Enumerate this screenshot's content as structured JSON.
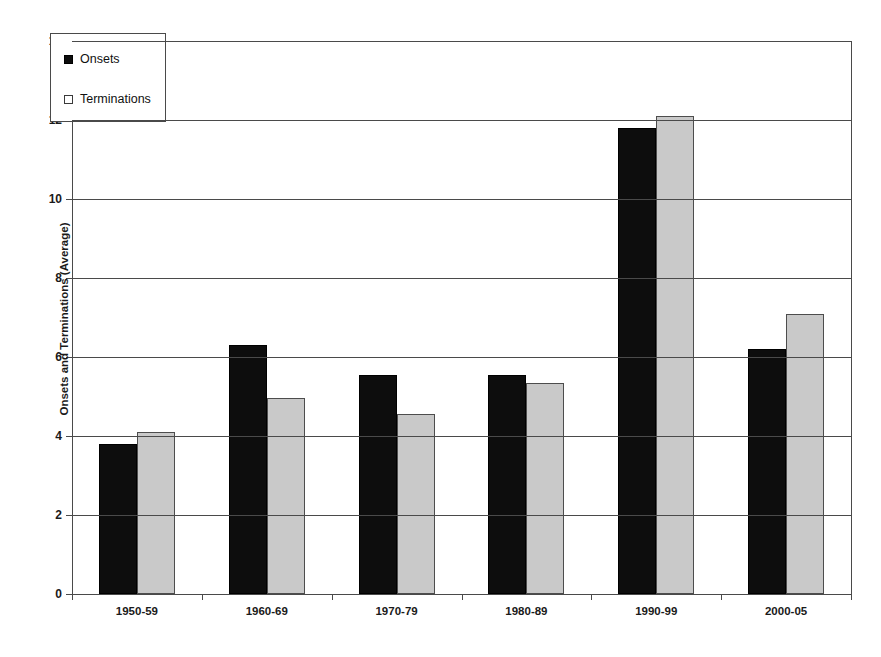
{
  "chart_data": {
    "type": "bar",
    "title": "",
    "xlabel": "Years",
    "ylabel": "Onsets and Terminations (Average)",
    "categories": [
      "1950-59",
      "1960-69",
      "1970-79",
      "1980-89",
      "1990-99",
      "2000-05"
    ],
    "series": [
      {
        "name": "Onsets",
        "values": [
          3.8,
          6.3,
          5.55,
          5.55,
          11.8,
          6.2
        ],
        "color": "#0d0d0d"
      },
      {
        "name": "Terminations",
        "values": [
          4.1,
          4.95,
          4.55,
          5.35,
          12.1,
          7.1
        ],
        "color": "#c9c9c9"
      }
    ],
    "ylim": [
      0,
      14
    ],
    "yticks": [
      0,
      2,
      4,
      6,
      8,
      10,
      12,
      14
    ],
    "ytick_labels": [
      "0",
      "2",
      "4",
      "6",
      "8",
      "10",
      "12",
      "14"
    ],
    "grid": true,
    "grid_axis": "y",
    "legend_position": "upper left",
    "legend_entries": [
      {
        "label": "Onsets",
        "marker": "filled-square"
      },
      {
        "label": "Terminations",
        "marker": "open-square"
      }
    ]
  }
}
